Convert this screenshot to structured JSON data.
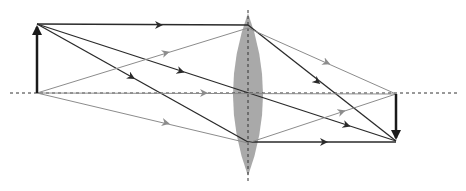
{
  "diagram": {
    "type": "converging-lens-ray-diagram",
    "colors": {
      "ray_dark": "#2a2a2a",
      "ray_light": "#8c8c8c",
      "lens_fill": "#a9a9a9",
      "axis": "#333333",
      "background": "#ffffff"
    },
    "optical_axis": {
      "y": 93,
      "x1": 10,
      "x2": 460
    },
    "lens": {
      "cx": 248,
      "top": 13,
      "bottom": 176,
      "half_width": 15,
      "axis_line_top": 10,
      "axis_line_bottom": 182
    },
    "object": {
      "x": 37,
      "base_y": 93,
      "tip_y": 24
    },
    "image": {
      "x": 396,
      "base_y": 94,
      "tip_y": 141
    },
    "rays": [
      {
        "name": "ray-parallel-top",
        "tone": "dark",
        "points": [
          [
            37,
            24
          ],
          [
            248,
            25
          ]
        ],
        "arrow": [
          155,
          25
        ]
      },
      {
        "name": "ray-parallel-top-refracted",
        "tone": "dark",
        "points": [
          [
            248,
            25
          ],
          [
            396,
            141
          ]
        ],
        "arrow": [
          314,
          79
        ]
      },
      {
        "name": "ray-through-center",
        "tone": "dark",
        "points": [
          [
            37,
            24
          ],
          [
            396,
            141
          ]
        ],
        "arrow": [
          177,
          70
        ],
        "arrow2": [
          343,
          124
        ]
      },
      {
        "name": "ray-through-focus",
        "tone": "dark",
        "points": [
          [
            37,
            24
          ],
          [
            248,
            142
          ]
        ],
        "arrow": [
          128,
          75
        ]
      },
      {
        "name": "ray-through-focus-refracted",
        "tone": "dark",
        "points": [
          [
            248,
            142
          ],
          [
            396,
            142
          ]
        ],
        "arrow": [
          320,
          142
        ]
      },
      {
        "name": "ray-base-upper",
        "tone": "light",
        "points": [
          [
            37,
            93
          ],
          [
            248,
            28
          ]
        ],
        "arrow": [
          162,
          54
        ]
      },
      {
        "name": "ray-base-upper-refracted",
        "tone": "light",
        "points": [
          [
            248,
            28
          ],
          [
            396,
            94
          ]
        ],
        "arrow": [
          323,
          61
        ]
      },
      {
        "name": "ray-base-lower",
        "tone": "light",
        "points": [
          [
            37,
            93
          ],
          [
            248,
            143
          ]
        ],
        "arrow": [
          162,
          122
        ]
      },
      {
        "name": "ray-base-lower-refracted",
        "tone": "light",
        "points": [
          [
            248,
            143
          ],
          [
            396,
            94
          ]
        ],
        "arrow": [
          338,
          113
        ]
      },
      {
        "name": "ray-base-axis",
        "tone": "light",
        "points": [
          [
            37,
            93
          ],
          [
            396,
            94
          ]
        ],
        "arrow": [
          200,
          93
        ],
        "dashed": true
      }
    ]
  }
}
